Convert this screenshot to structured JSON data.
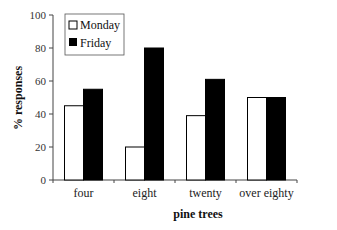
{
  "chart_data": {
    "type": "bar",
    "title": "",
    "xlabel": "pine trees",
    "ylabel": "% responses",
    "ylim": [
      0,
      100
    ],
    "yticks": [
      0,
      20,
      40,
      60,
      80,
      100
    ],
    "categories": [
      "four",
      "eight",
      "twenty",
      "over eighty"
    ],
    "series": [
      {
        "name": "Monday",
        "color": "#ffffff",
        "values": [
          45,
          20,
          39,
          50
        ]
      },
      {
        "name": "Friday",
        "color": "#000000",
        "values": [
          55,
          80,
          61,
          50
        ]
      }
    ],
    "grid": false,
    "legend_position": "top-left"
  }
}
